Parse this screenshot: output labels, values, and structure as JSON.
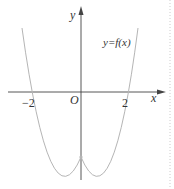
{
  "diagram": {
    "type": "function-graph",
    "axes": {
      "x_label": "x",
      "y_label": "y",
      "origin_label": "O"
    },
    "ticks": {
      "neg": "−2",
      "pos": "2"
    },
    "curve": {
      "label": "y=f(x)",
      "shape": "parabola opening upward, vertex on negative y-axis",
      "x_intercepts_approx": [
        -1.7,
        1.7
      ]
    },
    "colors": {
      "axis": "#444444",
      "curve": "#b5b5b5",
      "text": "#333333",
      "dotted_border": "#cccccc"
    }
  }
}
